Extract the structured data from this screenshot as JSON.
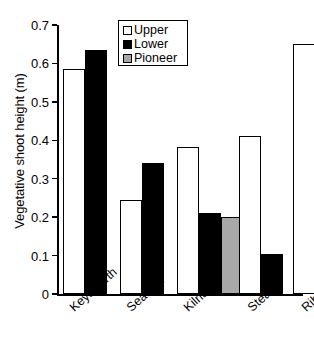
{
  "chart_data": {
    "type": "bar",
    "title": "",
    "xlabel": "",
    "ylabel": "Vegetative shoot height (m)",
    "categories": [
      "Keysworth",
      "Seafield",
      "Kilnsea",
      "Steart",
      "Ribble"
    ],
    "series": [
      {
        "name": "Upper",
        "color": "#ffffff",
        "values": [
          0.585,
          0.245,
          0.383,
          0.41,
          0.65
        ]
      },
      {
        "name": "Lower",
        "color": "#000000",
        "values": [
          0.635,
          0.34,
          0.21,
          0.105,
          0.157
        ]
      },
      {
        "name": "Pioneer",
        "color": "#a8a8a8",
        "values": [
          null,
          null,
          0.2,
          null,
          null
        ]
      }
    ],
    "ylim": [
      0,
      0.7
    ],
    "yticks": [
      0,
      0.1,
      0.2,
      0.3,
      0.4,
      0.5,
      0.6,
      0.7
    ],
    "ytick_labels": [
      "0",
      "0.1",
      "0.2",
      "0.3",
      "0.4",
      "0.5",
      "0.6",
      "0.7"
    ],
    "grid": false,
    "legend_position": "top-center",
    "legend_entries": [
      "Upper",
      "Lower",
      "Pioneer"
    ]
  },
  "axis": {
    "y_title": "Vegetative shoot height (m)",
    "tick_0": "0",
    "tick_1": "0.1",
    "tick_2": "0.2",
    "tick_3": "0.3",
    "tick_4": "0.4",
    "tick_5": "0.5",
    "tick_6": "0.6",
    "tick_7": "0.7"
  },
  "categories": {
    "c0": "Keysworth",
    "c1": "Seafield",
    "c2": "Kilnsea",
    "c3": "Steart",
    "c4": "Ribble"
  },
  "legend": {
    "upper": "Upper",
    "lower": "Lower",
    "pioneer": "Pioneer"
  }
}
